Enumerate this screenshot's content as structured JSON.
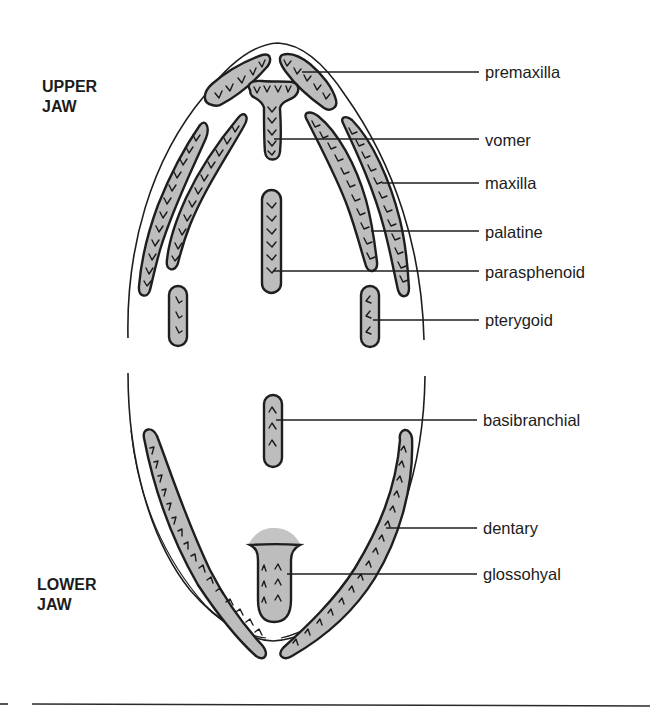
{
  "diagram": {
    "colors": {
      "bone_fill": "#bdbdbd",
      "stroke": "#1e1e1e",
      "background": "#ffffff"
    },
    "sections": {
      "upper_jaw": {
        "line1": "UPPER",
        "line2": "JAW"
      },
      "lower_jaw": {
        "line1": "LOWER",
        "line2": "JAW"
      }
    },
    "labels": {
      "premaxilla": "premaxilla",
      "vomer": "vomer",
      "maxilla": "maxilla",
      "palatine": "palatine",
      "parasphenoid": "parasphenoid",
      "pterygoid": "pterygoid",
      "basibranchial": "basibranchial",
      "dentary": "dentary",
      "glossohyal": "glossohyal"
    },
    "label_order": [
      "premaxilla",
      "vomer",
      "maxilla",
      "palatine",
      "parasphenoid",
      "pterygoid",
      "basibranchial",
      "dentary",
      "glossohyal"
    ]
  }
}
